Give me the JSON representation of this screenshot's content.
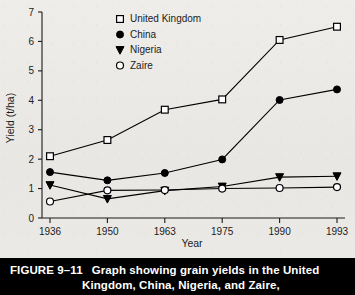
{
  "figure": {
    "number_label": "FIGURE 9–11",
    "caption_line1": "Graph showing grain yields in the United",
    "caption_line2": "Kingdom, China, Nigeria, and Zaire,",
    "bar_background": "#000000",
    "bar_text_color": "#ffffff"
  },
  "chart_data": {
    "type": "line",
    "title": "",
    "xlabel": "Year",
    "ylabel": "Yield (t/ha)",
    "categories": [
      "1936",
      "1950",
      "1963",
      "1975",
      "1990",
      "1993"
    ],
    "x": [
      1936,
      1950,
      1963,
      1975,
      1990,
      1993
    ],
    "ylim": [
      0,
      7
    ],
    "yticks": [
      "0",
      "1",
      "2",
      "3",
      "4",
      "5",
      "6",
      "7"
    ],
    "grid": false,
    "legend_position": "top-center",
    "series": [
      {
        "name": "United Kingdom",
        "marker": "open-square",
        "color": "#000000",
        "values": [
          2.1,
          2.65,
          3.68,
          4.03,
          6.05,
          6.5
        ]
      },
      {
        "name": "China",
        "marker": "filled-circle",
        "color": "#000000",
        "values": [
          1.56,
          1.28,
          1.53,
          1.99,
          4.01,
          4.37
        ]
      },
      {
        "name": "Nigeria",
        "marker": "filled-triangle-down",
        "color": "#000000",
        "values": [
          1.12,
          0.65,
          0.93,
          1.07,
          1.39,
          1.42
        ]
      },
      {
        "name": "Zaire",
        "marker": "open-circle",
        "color": "#000000",
        "values": [
          0.56,
          0.94,
          0.95,
          1.0,
          1.02,
          1.05
        ]
      }
    ]
  }
}
